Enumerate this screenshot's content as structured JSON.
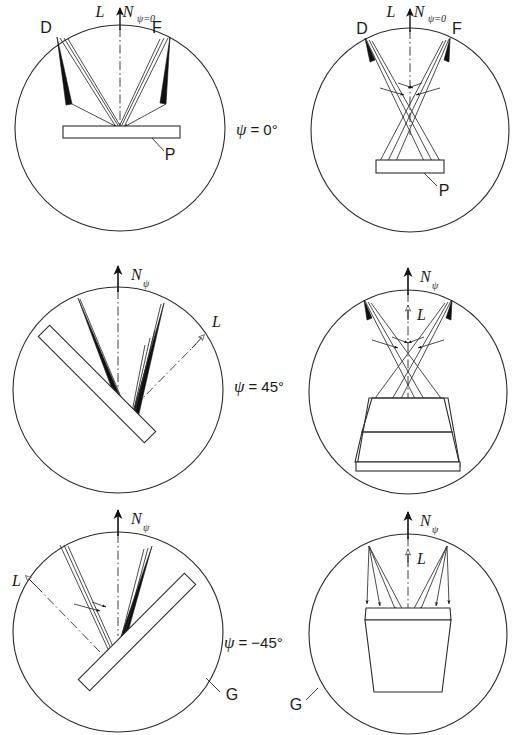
{
  "figure": {
    "kind": "x-ray-diffraction-psi-tilt-diagram",
    "panel_count": 6,
    "columns": 2,
    "rows": 3,
    "stroke_color": "#2b2b2b",
    "fill_color": "#ffffff",
    "beam_color": "#111111"
  },
  "rows": [
    {
      "id": "row-psi-0",
      "psi_label": "ψ = 0°",
      "psi_symbol": "ψ",
      "psi_value": "0°",
      "left": {
        "view": "side-view",
        "detector_label": "D",
        "focus_label": "F",
        "source_label": "L",
        "normal_label": "N",
        "normal_subscript": "ψ=0",
        "specimen_label": "P",
        "goniometer_label": ""
      },
      "right": {
        "view": "front-view",
        "detector_label": "D",
        "focus_label": "F",
        "source_label": "L",
        "normal_label": "N",
        "normal_subscript": "ψ=0",
        "specimen_label": "P",
        "goniometer_label": ""
      }
    },
    {
      "id": "row-psi-45",
      "psi_label": "ψ = 45°",
      "psi_symbol": "ψ",
      "psi_value": "45°",
      "left": {
        "view": "side-view",
        "detector_label": "",
        "focus_label": "",
        "source_label": "L",
        "normal_label": "N",
        "normal_subscript": "ψ",
        "specimen_label": "",
        "goniometer_label": ""
      },
      "right": {
        "view": "front-view",
        "detector_label": "",
        "focus_label": "",
        "source_label": "L",
        "normal_label": "N",
        "normal_subscript": "ψ",
        "specimen_label": "",
        "goniometer_label": ""
      }
    },
    {
      "id": "row-psi-minus45",
      "psi_label": "ψ = −45°",
      "psi_symbol": "ψ",
      "psi_value": "−45°",
      "left": {
        "view": "side-view",
        "detector_label": "",
        "focus_label": "",
        "source_label": "L",
        "normal_label": "N",
        "normal_subscript": "ψ",
        "specimen_label": "",
        "goniometer_label": "G"
      },
      "right": {
        "view": "front-view",
        "detector_label": "",
        "focus_label": "",
        "source_label": "L",
        "normal_label": "N",
        "normal_subscript": "ψ",
        "specimen_label": "",
        "goniometer_label": "G"
      }
    }
  ],
  "legend_keys": {
    "D": "detector",
    "F": "focus",
    "L": "x-ray-source-line",
    "N": "surface-normal",
    "P": "specimen-plate",
    "G": "goniometer-circle"
  }
}
